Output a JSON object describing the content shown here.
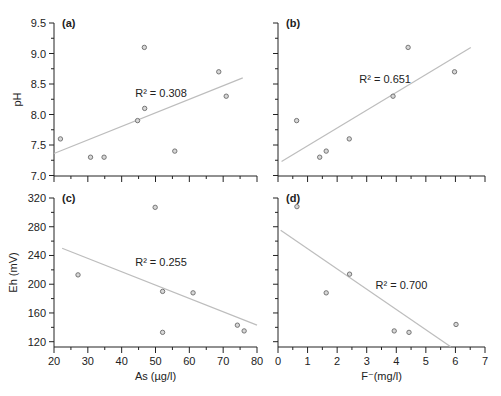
{
  "chart_data": [
    {
      "id": "a",
      "type": "scatter",
      "panel_label": "(a)",
      "xlabel": "",
      "ylabel": "pH",
      "xlim": [
        20,
        80
      ],
      "ylim": [
        7.0,
        9.5
      ],
      "x_ticks": [
        20,
        30,
        40,
        50,
        60,
        70,
        80
      ],
      "x_tick_labels_visible": false,
      "y_ticks": [
        7.0,
        7.5,
        8.0,
        8.5,
        9.0,
        9.5
      ],
      "y_tick_labels": [
        "7.0",
        "7.5",
        "8.0",
        "8.5",
        "9.0",
        "9.5"
      ],
      "y_tick_labels_visible": true,
      "points": [
        [
          21.9,
          7.6
        ],
        [
          30.8,
          7.3
        ],
        [
          34.8,
          7.3
        ],
        [
          44.7,
          7.9
        ],
        [
          46.7,
          9.1
        ],
        [
          46.8,
          8.1
        ],
        [
          55.7,
          7.4
        ],
        [
          68.7,
          8.7
        ],
        [
          70.9,
          8.3
        ]
      ],
      "trendline": [
        [
          20,
          7.36
        ],
        [
          75.8,
          8.6
        ]
      ],
      "annotation": {
        "text": "R² = 0.308",
        "x": 44,
        "y": 8.28
      },
      "grid": false
    },
    {
      "id": "b",
      "type": "scatter",
      "panel_label": "(b)",
      "xlabel": "",
      "ylabel": "",
      "xlim": [
        0,
        7
      ],
      "ylim": [
        7.0,
        9.5
      ],
      "x_ticks": [
        0,
        1,
        2,
        3,
        4,
        5,
        6,
        7
      ],
      "x_tick_labels_visible": false,
      "y_ticks": [
        7.0,
        7.5,
        8.0,
        8.5,
        9.0,
        9.5
      ],
      "y_tick_labels_visible": false,
      "points": [
        [
          0.63,
          7.9
        ],
        [
          1.41,
          7.3
        ],
        [
          1.63,
          7.4
        ],
        [
          2.41,
          7.6
        ],
        [
          3.89,
          8.3
        ],
        [
          4.4,
          9.1
        ],
        [
          5.97,
          8.7
        ]
      ],
      "trendline": [
        [
          0.12,
          7.23
        ],
        [
          6.52,
          9.1
        ]
      ],
      "annotation": {
        "text": "R² = 0.651",
        "x": 2.75,
        "y": 8.52
      },
      "grid": false
    },
    {
      "id": "c",
      "type": "scatter",
      "panel_label": "(c)",
      "xlabel": "As (µg/l)",
      "ylabel": "Eh (mV)",
      "xlim": [
        20,
        80
      ],
      "ylim": [
        110,
        320
      ],
      "x_ticks": [
        20,
        30,
        40,
        50,
        60,
        70,
        80
      ],
      "x_tick_labels": [
        "20",
        "30",
        "40",
        "50",
        "60",
        "70",
        "80"
      ],
      "x_tick_labels_visible": true,
      "y_ticks": [
        120,
        160,
        200,
        240,
        280,
        320
      ],
      "y_tick_labels": [
        "120",
        "160",
        "200",
        "240",
        "280",
        "320"
      ],
      "y_tick_labels_visible": true,
      "points": [
        [
          27.1,
          213
        ],
        [
          49.9,
          307
        ],
        [
          52.1,
          190
        ],
        [
          52.1,
          133
        ],
        [
          61.1,
          188
        ],
        [
          74.2,
          143
        ],
        [
          76.2,
          135
        ]
      ],
      "trendline": [
        [
          22.4,
          250
        ],
        [
          80,
          143
        ]
      ],
      "annotation": {
        "text": "R² = 0.255",
        "x": 44,
        "y": 225
      },
      "grid": false
    },
    {
      "id": "d",
      "type": "scatter",
      "panel_label": "(d)",
      "xlabel": "F⁻(mg/l)",
      "ylabel": "",
      "xlim": [
        0,
        7
      ],
      "ylim": [
        110,
        320
      ],
      "x_ticks": [
        0,
        1,
        2,
        3,
        4,
        5,
        6,
        7
      ],
      "x_tick_labels": [
        "0",
        "1",
        "2",
        "3",
        "4",
        "5",
        "6",
        "7"
      ],
      "x_tick_labels_visible": true,
      "y_ticks": [
        120,
        160,
        200,
        240,
        280,
        320
      ],
      "y_tick_labels_visible": false,
      "points": [
        [
          0.64,
          308
        ],
        [
          1.63,
          188
        ],
        [
          2.42,
          214
        ],
        [
          3.93,
          135
        ],
        [
          4.43,
          133
        ],
        [
          6.02,
          144
        ]
      ],
      "trendline": [
        [
          0.09,
          275
        ],
        [
          5.84,
          113
        ]
      ],
      "annotation": {
        "text": "R² = 0.700",
        "x": 3.3,
        "y": 193
      },
      "grid": false
    }
  ],
  "layout": {
    "panels": {
      "a": {
        "x0": 54,
        "x1": 257,
        "y_top": 23,
        "y_bottom": 175.5,
        "axis_y": 176
      },
      "b": {
        "x0": 278,
        "x1": 485,
        "y_top": 23,
        "y_bottom": 175.5,
        "axis_y": 176
      },
      "c": {
        "x0": 54,
        "x1": 257,
        "y_top": 198,
        "y_bottom": 347,
        "axis_y": 347
      },
      "d": {
        "x0": 278,
        "x1": 485,
        "y_top": 198,
        "y_bottom": 347,
        "axis_y": 347
      }
    }
  }
}
